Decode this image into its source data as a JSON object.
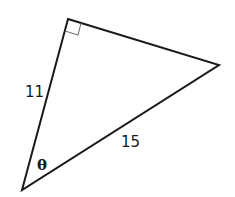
{
  "diagram": {
    "type": "right-triangle",
    "right_angle_vertex": "top",
    "labels": {
      "left_side": "11",
      "hypotenuse": "15",
      "angle": "θ"
    },
    "colors": {
      "stroke": "#1a1a1a",
      "mark": "#666666",
      "background": "#ffffff"
    }
  }
}
